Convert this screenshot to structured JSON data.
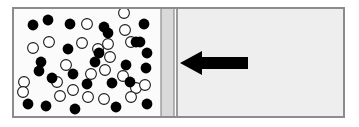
{
  "figure": {
    "name": "gas-container-with-piston-diagram",
    "type": "diagram",
    "caption": "",
    "canvas": {
      "width": 359,
      "height": 127
    },
    "background_color": "#ffffff"
  },
  "container": {
    "label": "container",
    "x": 12,
    "y": 7,
    "width": 333,
    "height": 111,
    "fill_color": "#f2f2f2",
    "border_color": "#8c8c8c",
    "border_width": 2
  },
  "left_chamber": {
    "label": "gas-filled-chamber",
    "x": 14,
    "y": 9,
    "width": 147,
    "height": 107,
    "fill_color": "#fbfbfb"
  },
  "piston": {
    "label": "movable-partition",
    "x": 161,
    "y": 9,
    "width": 13,
    "height": 107,
    "fill_color": "#d9d9d9",
    "edge_color": "#8c8c8c"
  },
  "piston_rod_line": {
    "label": "partition-inner-edge",
    "x": 176,
    "y": 9,
    "width": 2,
    "height": 107,
    "color": "#9a9a9a"
  },
  "right_chamber": {
    "label": "empty-chamber",
    "x": 178,
    "y": 9,
    "width": 165,
    "height": 107,
    "fill_color": "#eeeeee"
  },
  "arrow": {
    "label": "applied-force-arrow",
    "direction": "left",
    "color": "#000000",
    "tip_x": 180,
    "tail_x": 248,
    "center_y": 63,
    "head_half_height": 12,
    "head_length": 22,
    "shaft_half_height": 6
  },
  "particles": {
    "filled_label": "filled-particle",
    "open_label": "open-particle",
    "filled_color": "#000000",
    "open_fill_color": "#ffffff",
    "open_stroke_color": "#1a1a1a",
    "radius": 5.4,
    "open_stroke_width": 1.1,
    "filled_count": 26,
    "open_count": 24,
    "total_count": 50,
    "filled": [
      [
        33,
        25
      ],
      [
        48,
        20
      ],
      [
        70,
        24
      ],
      [
        104,
        27
      ],
      [
        144,
        24
      ],
      [
        108,
        33
      ],
      [
        136,
        42
      ],
      [
        140,
        42
      ],
      [
        68,
        49
      ],
      [
        99,
        53
      ],
      [
        147,
        53
      ],
      [
        41,
        62
      ],
      [
        39,
        71
      ],
      [
        52,
        78
      ],
      [
        73,
        74
      ],
      [
        87,
        84
      ],
      [
        112,
        83
      ],
      [
        130,
        82
      ],
      [
        146,
        68
      ],
      [
        95,
        62
      ],
      [
        28,
        104
      ],
      [
        46,
        106
      ],
      [
        75,
        109
      ],
      [
        116,
        107
      ],
      [
        147,
        104
      ],
      [
        126,
        65
      ]
    ],
    "open": [
      [
        124,
        13
      ],
      [
        87,
        24
      ],
      [
        125,
        30
      ],
      [
        49,
        42
      ],
      [
        82,
        43
      ],
      [
        131,
        42
      ],
      [
        33,
        48
      ],
      [
        98,
        49
      ],
      [
        108,
        44
      ],
      [
        24,
        82
      ],
      [
        57,
        82
      ],
      [
        73,
        90
      ],
      [
        91,
        74
      ],
      [
        105,
        70
      ],
      [
        123,
        76
      ],
      [
        136,
        88
      ],
      [
        60,
        96
      ],
      [
        88,
        97
      ],
      [
        104,
        99
      ],
      [
        131,
        97
      ],
      [
        23,
        92
      ],
      [
        110,
        57
      ],
      [
        145,
        85
      ],
      [
        66,
        65
      ]
    ]
  }
}
